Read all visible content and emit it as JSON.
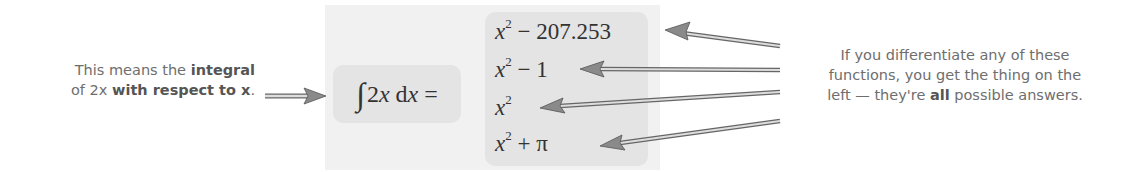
{
  "left_note": {
    "parts": [
      "This means the ",
      "integral",
      "of 2x ",
      "with respect to x",
      "."
    ]
  },
  "integral": {
    "symbol": "∫",
    "expr": "2x dx =",
    "var": "x"
  },
  "answers": [
    {
      "base": "x",
      "exp": "2",
      "rest": " − 207.253"
    },
    {
      "base": "x",
      "exp": "2",
      "rest": " − 1"
    },
    {
      "base": "x",
      "exp": "2",
      "rest": ""
    },
    {
      "base": "x",
      "exp": "2",
      "rest": " + π"
    }
  ],
  "right_note": {
    "line1": "If you differentiate any of these",
    "line2": "functions, you get the thing on the",
    "line3_pre": "left — they're ",
    "line3_bold": "all",
    "line3_post": " possible answers."
  },
  "colors": {
    "text": "#6e6e6e",
    "panel_light": "#f1f1f1",
    "panel_dark": "#e4e4e4",
    "arrow": "#8a8a8a"
  }
}
